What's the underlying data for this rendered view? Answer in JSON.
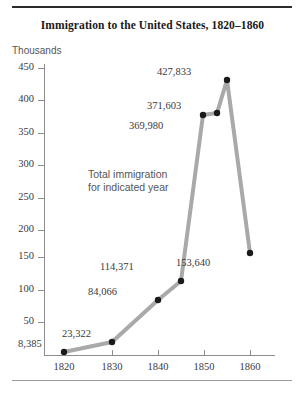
{
  "figure": {
    "title": "Immigration to the United States, 1820–1860",
    "unit_label": "Thousands",
    "annotation": "Total immigration\nfor indicated year",
    "line_color": "#a9a9a9",
    "marker_color": "#1a1a1a",
    "axis_color": "#8d8d8d",
    "text_color": "#3a3a3a",
    "rule_top_color": "#2b2b2b",
    "rule_bottom_color": "#9a9a9a"
  },
  "chart_data": {
    "type": "line",
    "title": "Immigration to the United States, 1820–1860",
    "xlabel": "",
    "ylabel": "Thousands",
    "xlim": [
      1820,
      1860
    ],
    "ylim": [
      0,
      450
    ],
    "grid": false,
    "legend": "none",
    "annotations": [
      "Total immigration for indicated year"
    ],
    "ytick_labels": [
      "450",
      "400",
      "350",
      "300",
      "250",
      "200",
      "150",
      "100",
      "50"
    ],
    "ytick_values": [
      450,
      400,
      350,
      300,
      250,
      200,
      150,
      100,
      50
    ],
    "xtick_labels": [
      "1820",
      "1830",
      "1840",
      "1850",
      "1860"
    ],
    "xtick_values": [
      1820,
      1830,
      1840,
      1850,
      1860
    ],
    "x": [
      1820,
      1830,
      1840,
      1845,
      1850,
      1854,
      1855,
      1860
    ],
    "values": [
      8385,
      23322,
      84066,
      114371,
      369980,
      371603,
      427833,
      153640
    ],
    "point_labels": [
      "8,385",
      "23,322",
      "84,066",
      "114,371",
      "369,980",
      "371,603",
      "427,833",
      "153,640"
    ]
  },
  "points": [
    {
      "label": "8,385",
      "year": "1820",
      "px": 64,
      "py": 352,
      "lx": 18,
      "ly": 338
    },
    {
      "label": "23,322",
      "year": "1830",
      "px": 112,
      "py": 342,
      "lx": 62,
      "ly": 328
    },
    {
      "label": "84,066",
      "year": "1840",
      "px": 158,
      "py": 300,
      "lx": 88,
      "ly": 286
    },
    {
      "label": "114,371",
      "year": "1845",
      "px": 181,
      "py": 281,
      "lx": 100,
      "ly": 261
    },
    {
      "label": "369,980",
      "year": "1850",
      "px": 203,
      "py": 115,
      "lx": 129,
      "ly": 120
    },
    {
      "label": "371,603",
      "year": "1854",
      "px": 217,
      "py": 113,
      "lx": 147,
      "ly": 100
    },
    {
      "label": "427,833",
      "year": "1855",
      "px": 227,
      "py": 80,
      "lx": 157,
      "ly": 66
    },
    {
      "label": "153,640",
      "year": "1860",
      "px": 250,
      "py": 253,
      "lx": 176,
      "ly": 257
    }
  ],
  "yticks": [
    {
      "label": "450",
      "py": 68
    },
    {
      "label": "400",
      "py": 100
    },
    {
      "label": "350",
      "py": 133
    },
    {
      "label": "300",
      "py": 165
    },
    {
      "label": "250",
      "py": 198
    },
    {
      "label": "200",
      "py": 230
    },
    {
      "label": "150",
      "py": 257
    },
    {
      "label": "100",
      "py": 290
    },
    {
      "label": "50",
      "py": 322
    }
  ],
  "xticks": [
    {
      "label": "1820",
      "px": 64
    },
    {
      "label": "1830",
      "px": 112
    },
    {
      "label": "1840",
      "px": 158
    },
    {
      "label": "1850",
      "px": 204
    },
    {
      "label": "1860",
      "px": 250
    }
  ]
}
